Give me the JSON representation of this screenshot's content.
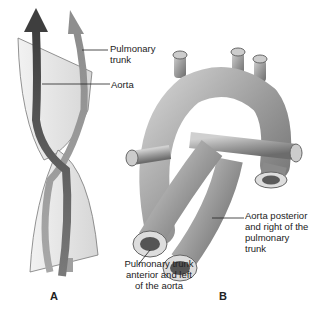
{
  "panel_a": {
    "letter": "A",
    "labels": {
      "pulmonary_trunk_line1": "Pulmonary",
      "pulmonary_trunk_line2": "trunk",
      "aorta": "Aorta"
    }
  },
  "panel_b": {
    "letter": "B",
    "labels": {
      "aorta_posterior_line1": "Aorta posterior",
      "aorta_posterior_line2": "and right of the",
      "aorta_posterior_line3": "pulmonary trunk",
      "pulmonary_anterior_line1": "Pulmonary trunk",
      "pulmonary_anterior_line2": "anterior and left",
      "pulmonary_anterior_line3": "of the aorta"
    }
  },
  "colors": {
    "aorta_arrow": "#555555",
    "pulmonary_arrow": "#9a9a9a",
    "septum": "#e2e2e2",
    "vessel": "#a8a8a8"
  }
}
